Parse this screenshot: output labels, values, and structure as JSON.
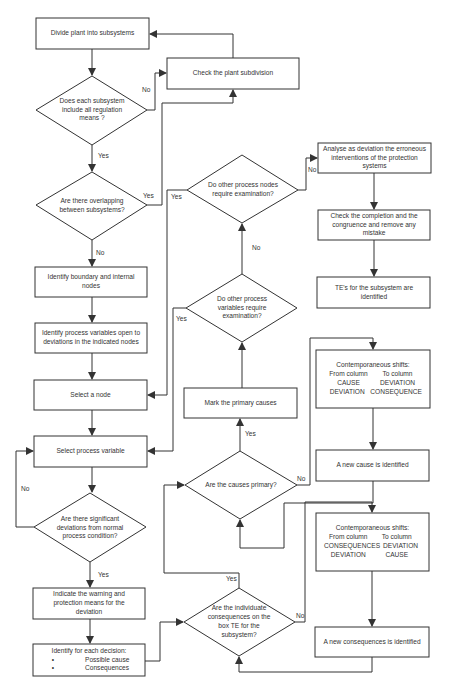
{
  "diagram": {
    "type": "flowchart",
    "colors": {
      "stroke": "#333333",
      "text": "#333333",
      "background": "#ffffff"
    },
    "boxes": {
      "divide": "Divide plant into subsystems",
      "check_subdivision": "Check the plant subdivision",
      "identify_nodes": "Identify boundary and internal nodes",
      "identify_variables": "Identify process variables open to deviations in the indicated nodes",
      "select_node": "Select a node",
      "select_variable": "Select process variable",
      "indicate_warning": "Indicate the warning and protection means for the deviation",
      "identify_decision": {
        "title": "Identify for each decision:",
        "bullets": [
          "Possible cause",
          "Consequences"
        ],
        "bullet_symbol": "•"
      },
      "analyse": "Analyse as deviation the erroneous interventions of the protection systems",
      "check_completion": "Check the completion and the congruence and remove any mistake",
      "te_identified": "TE's for the subsystem are identified",
      "mark_primary": "Mark the primary causes",
      "shift_causes": {
        "title": "Contemporaneous shifts:",
        "from_header": "From column",
        "to_header": "To column",
        "rows": [
          [
            "CAUSE",
            "DEVIATION"
          ],
          [
            "DEVIATION",
            "CONSEQUENCE"
          ]
        ]
      },
      "new_cause": "A new cause is identified",
      "shift_consequences": {
        "title": "Contemporaneous shifts:",
        "from_header": "From column",
        "to_header": "To column",
        "rows": [
          [
            "CONSEQUENCES",
            "DEVIATION"
          ],
          [
            "DEVIATION",
            "CAUSE"
          ]
        ]
      },
      "new_consequence": "A new consequences is identified"
    },
    "decisions": {
      "regulation_means": "Does each subsystem include all regulation means ?",
      "overlapping": "Are there overlapping between subsystems?",
      "significant_deviations": "Are there significant deviations from normal process condition?",
      "other_nodes": "Do other process nodes require examination?",
      "other_variables": "Do other process variables require examination?",
      "causes_primary": "Are the causes primary?",
      "individuate_consequences": "Are the individuate consequences on the box TE for the subsystem?"
    },
    "edge_labels": {
      "yes": "Yes",
      "no": "No"
    }
  }
}
